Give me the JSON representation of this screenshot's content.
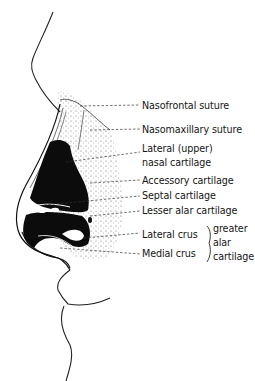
{
  "figure": {
    "labels": [
      {
        "id": "nasofrontal-suture",
        "text": "Nasofrontal suture"
      },
      {
        "id": "nasomaxillary-suture",
        "text": "Nasomaxillary suture"
      },
      {
        "id": "lateral-upper-1",
        "text": "Lateral (upper)"
      },
      {
        "id": "lateral-upper-2",
        "text": "nasal cartilage"
      },
      {
        "id": "accessory-cartilage",
        "text": "Accessory cartilage"
      },
      {
        "id": "septal-cartilage",
        "text": "Septal cartilage"
      },
      {
        "id": "lesser-alar-cartilage",
        "text": "Lesser alar cartilage"
      },
      {
        "id": "lateral-crus",
        "text": "Lateral crus"
      },
      {
        "id": "medial-crus",
        "text": "Medial crus"
      }
    ],
    "group_label": {
      "lines": [
        "greater",
        "alar",
        "cartilage"
      ]
    }
  }
}
